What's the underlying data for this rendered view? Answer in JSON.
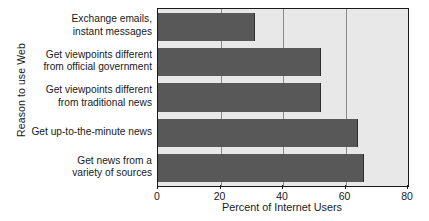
{
  "chart_data": {
    "type": "bar",
    "orientation": "horizontal",
    "title": "",
    "xlabel": "Percent of Internet Users",
    "ylabel": "Reason to use Web",
    "categories": [
      "Exchange emails,\ninstant messages",
      "Get viewpoints different\nfrom official government",
      "Get viewpoints different\nfrom traditional news",
      "Get up-to-the-minute news",
      "Get news from a\nvariety of sources"
    ],
    "values": [
      31,
      52,
      52,
      64,
      66
    ],
    "xlim": [
      0,
      80
    ],
    "xticks": [
      0,
      20,
      40,
      60,
      80
    ],
    "xtick_labels": [
      "0",
      "20",
      "40",
      "60",
      "80"
    ],
    "grid": true,
    "grid_axis": "x",
    "legend": false,
    "colors": {
      "bar_fill": "#585858",
      "plot_background": "#e8e8e8",
      "axis_line": "#1a1a1a",
      "gridline": "#8a8a8a",
      "text": "#1a1a1a"
    }
  }
}
